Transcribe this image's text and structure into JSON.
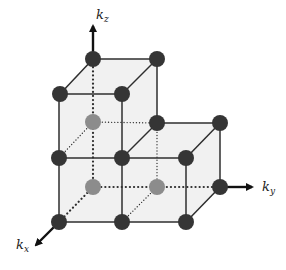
{
  "axes": {
    "kz": {
      "base": "k",
      "sub": "z"
    },
    "ky": {
      "base": "k",
      "sub": "y"
    },
    "kx": {
      "base": "k",
      "sub": "x"
    }
  },
  "colors": {
    "edge": "#2e2e2e",
    "face_fill": "#f1f1f1",
    "node_dark": "#353535",
    "node_grey": "#8c8c8c",
    "arrow": "#111111",
    "background": "#ffffff"
  },
  "nodes": [
    {
      "id": "top-back-left",
      "x": 93,
      "y": 59,
      "type": "dark"
    },
    {
      "id": "top-back-right",
      "x": 157,
      "y": 59,
      "type": "dark"
    },
    {
      "id": "top-front-left",
      "x": 60,
      "y": 94,
      "type": "dark"
    },
    {
      "id": "top-front-right",
      "x": 122,
      "y": 94,
      "type": "dark"
    },
    {
      "id": "mid-back-left",
      "x": 93,
      "y": 122,
      "type": "grey"
    },
    {
      "id": "mid-back-mid",
      "x": 157,
      "y": 123,
      "type": "dark"
    },
    {
      "id": "mid-back-right",
      "x": 220,
      "y": 123,
      "type": "dark"
    },
    {
      "id": "mid-front-left",
      "x": 59,
      "y": 158,
      "type": "dark"
    },
    {
      "id": "mid-front-mid",
      "x": 122,
      "y": 158,
      "type": "dark"
    },
    {
      "id": "mid-front-right",
      "x": 186,
      "y": 158,
      "type": "dark"
    },
    {
      "id": "bot-back-left",
      "x": 93,
      "y": 187,
      "type": "grey"
    },
    {
      "id": "bot-back-mid",
      "x": 157,
      "y": 187,
      "type": "grey"
    },
    {
      "id": "bot-back-right",
      "x": 220,
      "y": 187,
      "type": "dark"
    },
    {
      "id": "bot-front-left",
      "x": 59,
      "y": 222,
      "type": "dark"
    },
    {
      "id": "bot-front-mid",
      "x": 122,
      "y": 222,
      "type": "dark"
    },
    {
      "id": "bot-front-right",
      "x": 186,
      "y": 222,
      "type": "dark"
    }
  ]
}
